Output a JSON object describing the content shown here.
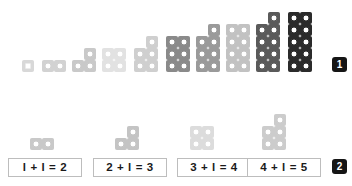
{
  "page": {
    "background": "#ffffff"
  },
  "sections": [
    {
      "id": "top-sequence",
      "badge": "1",
      "description": "Ten growing figures made of square tiles, shaded progressively darker from light grey to near black."
    },
    {
      "id": "bottom-sequence",
      "badge": "2",
      "description": "Four figures with matching addition sentences below."
    }
  ],
  "top_row": {
    "badge_label": "1",
    "figures": [
      {
        "name": "figure-1",
        "cells": 1,
        "color": "#d8d8d8",
        "dotted": false
      },
      {
        "name": "figure-2",
        "cells": 2,
        "color": "#d2d2d2",
        "dotted": true
      },
      {
        "name": "figure-3",
        "cells": 3,
        "color": "#c9c9c9",
        "dotted": true
      },
      {
        "name": "figure-4",
        "cells": 4,
        "color": "#e2e2e2",
        "dotted": true
      },
      {
        "name": "figure-5",
        "cells": 5,
        "color": "#cfcfcf",
        "dotted": true
      },
      {
        "name": "figure-6",
        "cells": 6,
        "color": "#8a8a8a",
        "dotted": true
      },
      {
        "name": "figure-7",
        "cells": 7,
        "color": "#9a9a9a",
        "dotted": true
      },
      {
        "name": "figure-8",
        "cells": 8,
        "color": "#c2c2c2",
        "dotted": true
      },
      {
        "name": "figure-9",
        "cells": 9,
        "color": "#5a5a5a",
        "dotted": true
      },
      {
        "name": "figure-10",
        "cells": 10,
        "color": "#2b2b2b",
        "dotted": true
      }
    ]
  },
  "bottom_row": {
    "badge_label": "2",
    "items": [
      {
        "name": "item-1",
        "cells": 2,
        "color": "#c9c9c9",
        "equation": "l + l = 2"
      },
      {
        "name": "item-2",
        "cells": 3,
        "color": "#c4c4c4",
        "equation": "2 + l = 3"
      },
      {
        "name": "item-3",
        "cells": 4,
        "color": "#dcdcdc",
        "equation": "3 + l = 4"
      },
      {
        "name": "item-4",
        "cells": 5,
        "color": "#cccccc",
        "equation": "4 + l = 5"
      }
    ]
  },
  "chart_data": {
    "type": "bar",
    "categories": [
      "1",
      "2",
      "3",
      "4",
      "5",
      "6",
      "7",
      "8",
      "9",
      "10"
    ],
    "values": [
      1,
      2,
      3,
      4,
      5,
      6,
      7,
      8,
      9,
      10
    ],
    "xlabel": "",
    "ylabel": "number of tiles",
    "ylim": [
      0,
      10
    ]
  }
}
